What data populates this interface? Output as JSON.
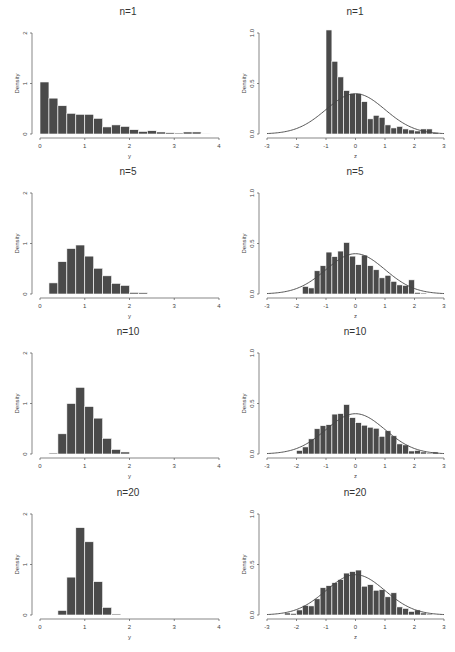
{
  "figure": {
    "bar_color": "#4a4a4a",
    "curve_color": "#444444",
    "background": "#ffffff"
  },
  "chart_data": [
    {
      "type": "bar",
      "panel": "row1-left",
      "title": "n=1",
      "xlabel": "y",
      "ylabel": "Density",
      "xlim": [
        0,
        4
      ],
      "ylim": [
        0,
        2
      ],
      "xticks": [
        "0",
        "1",
        "2",
        "3",
        "4"
      ],
      "yticks": [
        "0",
        "1",
        "2"
      ],
      "bin_start": 0.0,
      "bin_width": 0.2,
      "values": [
        1.03,
        0.71,
        0.56,
        0.41,
        0.39,
        0.39,
        0.31,
        0.14,
        0.18,
        0.15,
        0.085,
        0.05,
        0.065,
        0.04,
        0.025,
        0.02,
        0.04,
        0.04,
        0.01
      ]
    },
    {
      "type": "bar",
      "panel": "row1-right",
      "title": "n=1",
      "xlabel": "z",
      "ylabel": "Density",
      "xlim": [
        -3,
        3
      ],
      "ylim": [
        0,
        1.0
      ],
      "xticks": [
        "-3",
        "-2",
        "-1",
        "0",
        "1",
        "2",
        "3"
      ],
      "yticks": [
        "0.0",
        "0.5",
        "1.0"
      ],
      "bin_start": -1.0,
      "bin_width": 0.2,
      "values": [
        1.03,
        0.72,
        0.565,
        0.43,
        0.4,
        0.4,
        0.32,
        0.15,
        0.185,
        0.165,
        0.09,
        0.06,
        0.075,
        0.05,
        0.04,
        0.03,
        0.05,
        0.05,
        0.015
      ],
      "overlay": "standard normal density curve"
    },
    {
      "type": "bar",
      "panel": "row2-left",
      "title": "n=5",
      "xlabel": "y",
      "ylabel": "Density",
      "xlim": [
        0,
        4
      ],
      "ylim": [
        0,
        2
      ],
      "xticks": [
        "0",
        "1",
        "2",
        "3",
        "4"
      ],
      "yticks": [
        "0",
        "1",
        "2"
      ],
      "bin_start": 0.2,
      "bin_width": 0.2,
      "values": [
        0.22,
        0.64,
        0.9,
        0.97,
        0.75,
        0.51,
        0.36,
        0.21,
        0.17,
        0.03,
        0.025
      ]
    },
    {
      "type": "bar",
      "panel": "row2-right",
      "title": "n=5",
      "xlabel": "z",
      "ylabel": "Density",
      "xlim": [
        -3,
        3
      ],
      "ylim": [
        0,
        1.0
      ],
      "xticks": [
        "-3",
        "-2",
        "-1",
        "0",
        "1",
        "2",
        "3"
      ],
      "yticks": [
        "0.0",
        "0.5",
        "1.0"
      ],
      "bin_start": -1.8,
      "bin_width": 0.2,
      "values": [
        0.075,
        0.06,
        0.23,
        0.28,
        0.415,
        0.37,
        0.425,
        0.51,
        0.375,
        0.29,
        0.385,
        0.28,
        0.24,
        0.16,
        0.185,
        0.125,
        0.09,
        0.085,
        0.14,
        0.015,
        0.01
      ],
      "overlay": "standard normal density curve"
    },
    {
      "type": "bar",
      "panel": "row3-left",
      "title": "n=10",
      "xlabel": "y",
      "ylabel": "Density",
      "xlim": [
        0,
        4
      ],
      "ylim": [
        0,
        2
      ],
      "xticks": [
        "0",
        "1",
        "2",
        "3",
        "4"
      ],
      "yticks": [
        "0",
        "1",
        "2"
      ],
      "bin_start": 0.2,
      "bin_width": 0.2,
      "values": [
        0.02,
        0.4,
        1.0,
        1.32,
        0.94,
        0.71,
        0.31,
        0.09,
        0.04
      ]
    },
    {
      "type": "bar",
      "panel": "row3-right",
      "title": "n=10",
      "xlabel": "z",
      "ylabel": "Density",
      "xlim": [
        -3,
        3
      ],
      "ylim": [
        0,
        1.0
      ],
      "xticks": [
        "-3",
        "-2",
        "-1",
        "0",
        "1",
        "2",
        "3"
      ],
      "yticks": [
        "0.0",
        "0.5",
        "1.0"
      ],
      "bin_start": -2.0,
      "bin_width": 0.2,
      "values": [
        0.035,
        0.07,
        0.15,
        0.25,
        0.28,
        0.29,
        0.395,
        0.4,
        0.49,
        0.36,
        0.31,
        0.285,
        0.265,
        0.255,
        0.175,
        0.23,
        0.18,
        0.1,
        0.09,
        0.03,
        0.035,
        0.02,
        0.01,
        0.02
      ],
      "overlay": "standard normal density curve"
    },
    {
      "type": "bar",
      "panel": "row4-left",
      "title": "n=20",
      "xlabel": "y",
      "ylabel": "Density",
      "xlim": [
        0,
        4
      ],
      "ylim": [
        0,
        2
      ],
      "xticks": [
        "0",
        "1",
        "2",
        "3",
        "4"
      ],
      "yticks": [
        "0",
        "1",
        "2"
      ],
      "bin_start": 0.4,
      "bin_width": 0.2,
      "values": [
        0.09,
        0.75,
        1.73,
        1.45,
        0.66,
        0.15,
        0.02
      ]
    },
    {
      "type": "bar",
      "panel": "row4-right",
      "title": "n=20",
      "xlabel": "z",
      "ylabel": "Density",
      "xlim": [
        -3,
        3
      ],
      "ylim": [
        0,
        1.0
      ],
      "xticks": [
        "-3",
        "-2",
        "-1",
        "0",
        "1",
        "2",
        "3"
      ],
      "yticks": [
        "0.0",
        "0.5",
        "1.0"
      ],
      "bin_start": -2.4,
      "bin_width": 0.2,
      "values": [
        0.02,
        0.015,
        0.05,
        0.095,
        0.09,
        0.16,
        0.27,
        0.29,
        0.32,
        0.35,
        0.415,
        0.43,
        0.445,
        0.285,
        0.3,
        0.245,
        0.25,
        0.18,
        0.22,
        0.08,
        0.065,
        0.035,
        0.05,
        0.02,
        0.01
      ],
      "overlay": "standard normal density curve"
    }
  ]
}
